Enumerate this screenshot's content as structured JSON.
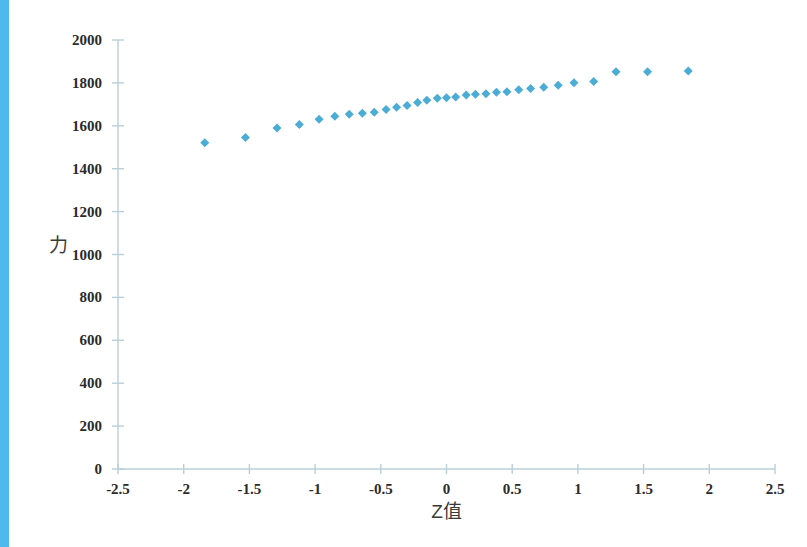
{
  "decor": {
    "left_strip_color": "#4FB8ED"
  },
  "axis_titles": {
    "y": "力",
    "x": "Z值"
  },
  "chart_data": {
    "type": "scatter",
    "title": "",
    "xlabel": "Z值",
    "ylabel": "力",
    "xlim": [
      -2.5,
      2.5
    ],
    "ylim": [
      0,
      2000
    ],
    "xticks": [
      -2.5,
      -2,
      -1.5,
      -1,
      -0.5,
      0,
      0.5,
      1,
      1.5,
      2,
      2.5
    ],
    "xtick_labels": [
      "-2.5",
      "-2",
      "-1.5",
      "-1",
      "-0.5",
      "0",
      "0.5",
      "1",
      "1.5",
      "2",
      "2.5"
    ],
    "yticks": [
      0,
      200,
      400,
      600,
      800,
      1000,
      1200,
      1400,
      1600,
      1800,
      2000
    ],
    "ytick_labels": [
      "0",
      "200",
      "400",
      "600",
      "800",
      "1000",
      "1200",
      "1400",
      "1600",
      "1800",
      "2000"
    ],
    "grid": false,
    "legend": false,
    "marker": "diamond",
    "marker_color": "#4BACD6",
    "marker_size": 9,
    "series": [
      {
        "name": "力",
        "x": [
          -1.84,
          -1.53,
          -1.29,
          -1.12,
          -0.97,
          -0.85,
          -0.74,
          -0.64,
          -0.55,
          -0.46,
          -0.38,
          -0.3,
          -0.22,
          -0.15,
          -0.07,
          0.0,
          0.07,
          0.15,
          0.22,
          0.3,
          0.38,
          0.46,
          0.55,
          0.64,
          0.74,
          0.85,
          0.97,
          1.12,
          1.29,
          1.53,
          1.84
        ],
        "y": [
          1521,
          1546,
          1590,
          1606,
          1631,
          1645,
          1654,
          1658,
          1663,
          1676,
          1686,
          1695,
          1709,
          1719,
          1729,
          1731,
          1734,
          1744,
          1747,
          1749,
          1756,
          1759,
          1768,
          1774,
          1780,
          1789,
          1801,
          1806,
          1852,
          1852,
          1855
        ]
      }
    ]
  }
}
